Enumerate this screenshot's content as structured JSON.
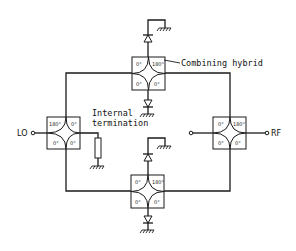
{
  "diagram": {
    "type": "schematic",
    "labels": {
      "lo": "LO",
      "rf": "RF",
      "combining_hybrid": "Combining hybrid",
      "internal_termination_line1": "Internal",
      "internal_termination_line2": "termination"
    },
    "hybrids": [
      {
        "id": "top",
        "ports": {
          "tl": "0°",
          "tr": "180°",
          "bl": "0°",
          "br": "0°"
        }
      },
      {
        "id": "left",
        "ports": {
          "tl": "180°",
          "tr": "0°",
          "bl": "0°",
          "br": "0°"
        }
      },
      {
        "id": "right",
        "ports": {
          "tl": "0°",
          "tr": "180°",
          "bl": "0°",
          "br": "0°"
        }
      },
      {
        "id": "bottom",
        "ports": {
          "tl": "0°",
          "tr": "180°",
          "bl": "0°",
          "br": "0°"
        }
      }
    ],
    "colors": {
      "line": "#1a1a1a",
      "background": "#ffffff"
    }
  }
}
